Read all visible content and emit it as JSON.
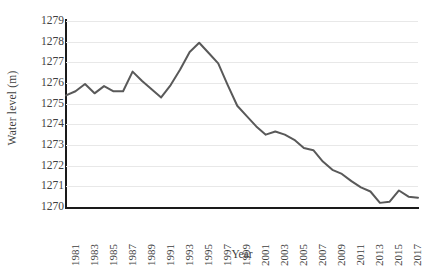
{
  "chart_data": {
    "type": "line",
    "title": "",
    "xlabel": "Year",
    "ylabel": "Water level (m)",
    "xlim": [
      1981,
      2018
    ],
    "ylim": [
      1270,
      1279
    ],
    "y_ticks": [
      1270,
      1271,
      1272,
      1273,
      1274,
      1275,
      1276,
      1277,
      1278,
      1279
    ],
    "y_tick_labels": [
      "1270",
      "1271",
      "1272",
      "1273",
      "1274",
      "1275",
      "1276",
      "1277",
      "1278",
      "1279"
    ],
    "x_tick_labels": [
      "1981",
      "1983",
      "1985",
      "1987",
      "1989",
      "1991",
      "1993",
      "1995",
      "1997",
      "1999",
      "2001",
      "2003",
      "2005",
      "2007",
      "2009",
      "2011",
      "2013",
      "2015",
      "2017"
    ],
    "x_tick_values": [
      1981,
      1983,
      1985,
      1987,
      1989,
      1991,
      1993,
      1995,
      1997,
      1999,
      2001,
      2003,
      2005,
      2007,
      2009,
      2011,
      2013,
      2015,
      2017
    ],
    "x_tick_rotation": -90,
    "grid": true,
    "grid_axis": "y",
    "legend": false,
    "legend_position": "none",
    "line_color": "#595959",
    "line_width": 2,
    "grid_color": "#e8e8e8",
    "axis_color": "#1a1a1a",
    "series": [
      {
        "name": "Water level",
        "x": [
          1981,
          1982,
          1983,
          1984,
          1985,
          1986,
          1987,
          1988,
          1989,
          1990,
          1991,
          1992,
          1993,
          1994,
          1995,
          1996,
          1997,
          1998,
          1999,
          2000,
          2001,
          2002,
          2003,
          2004,
          2005,
          2006,
          2007,
          2008,
          2009,
          2010,
          2011,
          2012,
          2013,
          2014,
          2015,
          2016,
          2017,
          2018
        ],
        "values": [
          1275.4,
          1275.6,
          1275.95,
          1275.5,
          1275.85,
          1275.6,
          1275.6,
          1276.55,
          1276.1,
          1275.7,
          1275.3,
          1275.9,
          1276.65,
          1277.5,
          1277.95,
          1277.45,
          1276.95,
          1275.9,
          1274.9,
          1274.4,
          1273.9,
          1273.5,
          1273.65,
          1273.5,
          1273.25,
          1272.85,
          1272.75,
          1272.2,
          1271.8,
          1271.6,
          1271.25,
          1270.95,
          1270.75,
          1270.2,
          1270.25,
          1270.8,
          1270.5,
          1270.45
        ]
      }
    ]
  }
}
